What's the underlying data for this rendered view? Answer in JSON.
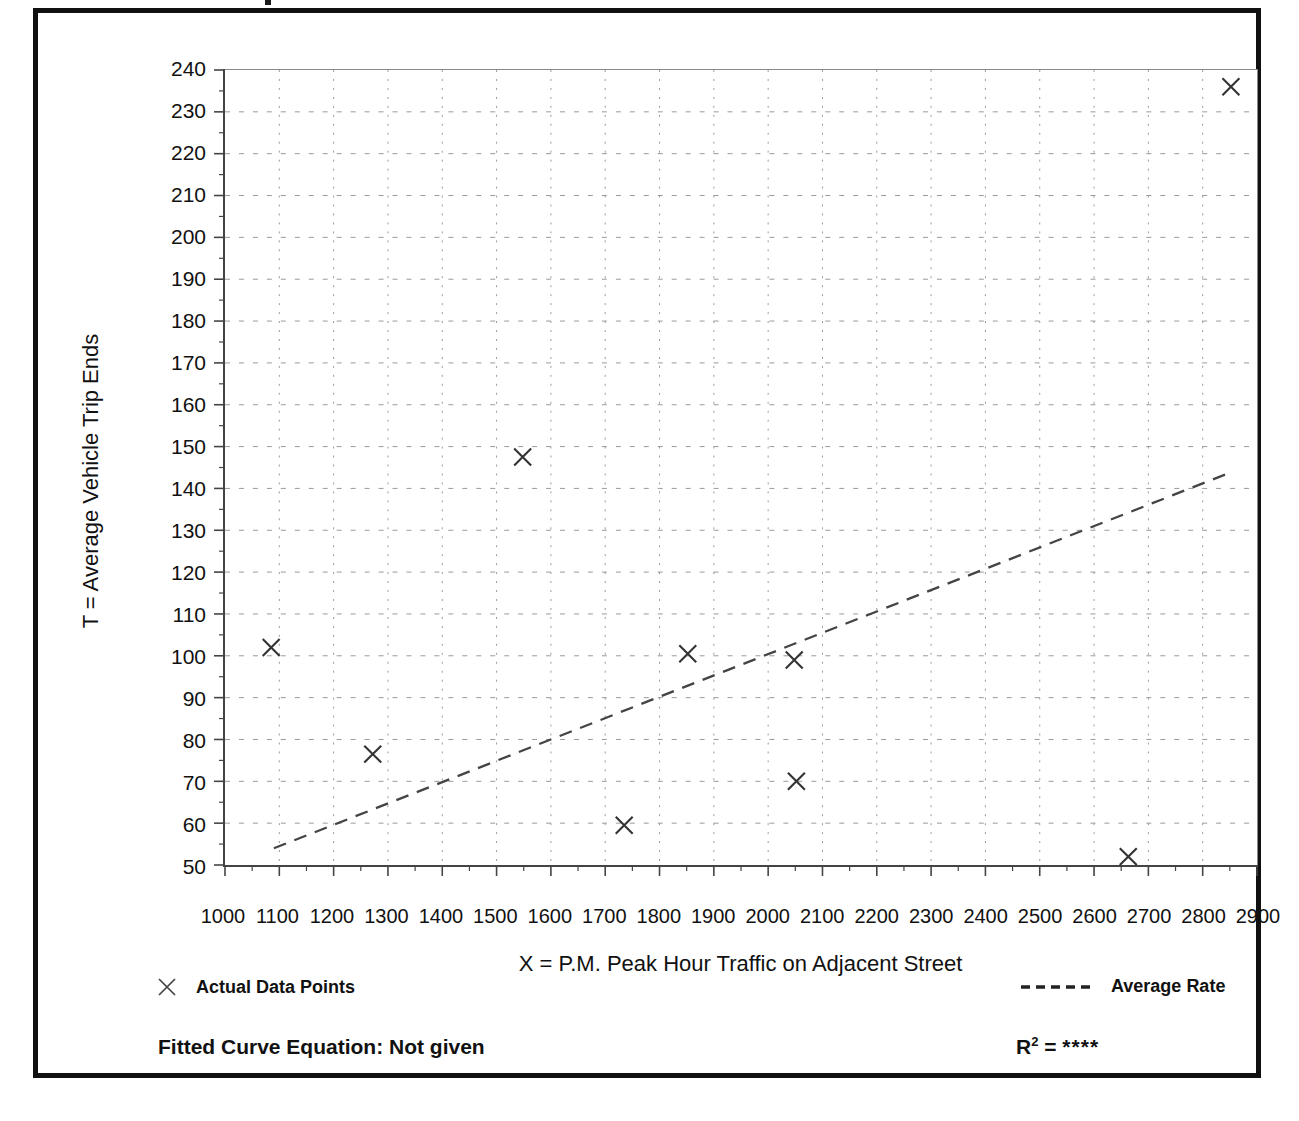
{
  "chart_data": {
    "type": "scatter",
    "title": "",
    "xlabel": "X = P.M. Peak Hour Traffic on Adjacent Street",
    "ylabel": "T = Average Vehicle Trip Ends",
    "xlim": [
      1000,
      2900
    ],
    "ylim": [
      50,
      240
    ],
    "x_tick_step": 100,
    "y_tick_step": 10,
    "y_minor_tick_step": 5,
    "grid": true,
    "grid_style": "dashed",
    "legend_position": "below-plot",
    "x_ticks": [
      1000,
      1100,
      1200,
      1300,
      1400,
      1500,
      1600,
      1700,
      1800,
      1900,
      2000,
      2100,
      2200,
      2300,
      2400,
      2500,
      2600,
      2700,
      2800,
      2900
    ],
    "y_ticks": [
      50,
      60,
      70,
      80,
      90,
      100,
      110,
      120,
      130,
      140,
      150,
      160,
      170,
      180,
      190,
      200,
      210,
      220,
      230,
      240
    ],
    "series": [
      {
        "name": "Actual Data Points",
        "type": "scatter",
        "marker": "x",
        "points": [
          {
            "x": 1085,
            "y": 102
          },
          {
            "x": 1272,
            "y": 76.5
          },
          {
            "x": 1548,
            "y": 147.5
          },
          {
            "x": 1735,
            "y": 59.5
          },
          {
            "x": 1852,
            "y": 100.5
          },
          {
            "x": 2048,
            "y": 99
          },
          {
            "x": 2052,
            "y": 70
          },
          {
            "x": 2663,
            "y": 52
          },
          {
            "x": 2852,
            "y": 236
          }
        ]
      },
      {
        "name": "Average Rate",
        "type": "line",
        "style": "dashed",
        "endpoints": [
          {
            "x": 1090,
            "y": 54
          },
          {
            "x": 2855,
            "y": 144
          }
        ]
      }
    ]
  },
  "axes": {
    "x_title": "X = P.M. Peak Hour Traffic on Adjacent Street",
    "y_title": "T = Average Vehicle Trip Ends"
  },
  "legend": {
    "data_points_label": "Actual Data Points",
    "average_rate_label": "Average Rate",
    "data_points_marker": "x-marker-icon",
    "average_rate_marker": "dashed-line-icon"
  },
  "footer": {
    "fitted_curve_text": "Fitted Curve Equation:  Not given",
    "r_squared_prefix": "R",
    "r_squared_exponent": "2",
    "r_squared_equals": " = ",
    "r_squared_value": "****"
  },
  "colors": {
    "frame": "#111111",
    "axis": "#444444",
    "grid": "#9a9a9a",
    "marker": "#333333",
    "trendline": "#444444",
    "background": "#ffffff"
  }
}
